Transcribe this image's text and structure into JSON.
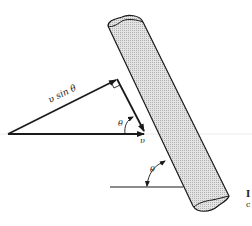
{
  "figure": {
    "labels": {
      "v_sin_theta": "υ sin θ",
      "theta_top": "θ",
      "v": "υ",
      "theta_bottom": "θ"
    },
    "caption_fragment": {
      "line1": "I",
      "line2": "c"
    },
    "colors": {
      "stroke": "#1a1a1a",
      "pipe_fill": "#d9d9d9",
      "baseline": "#e6e6e6"
    }
  }
}
